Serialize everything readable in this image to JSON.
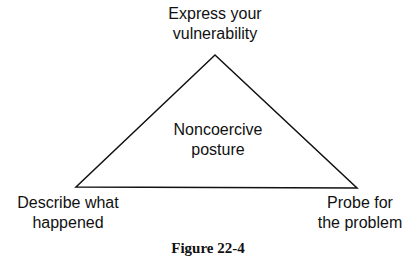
{
  "diagram": {
    "shape": "triangle",
    "vertices": {
      "top": {
        "line1": "Express your",
        "line2": "vulnerability"
      },
      "bottom_left": {
        "line1": "Describe what",
        "line2": "happened"
      },
      "bottom_right": {
        "line1": "Probe for",
        "line2": "the problem"
      }
    },
    "center": {
      "line1": "Noncoercive",
      "line2": "posture"
    },
    "line_color": "#111111"
  },
  "caption": "Figure 22-4"
}
